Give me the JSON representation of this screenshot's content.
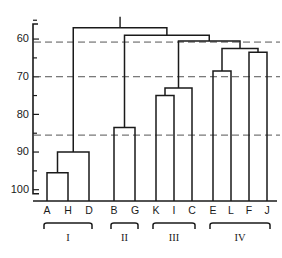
{
  "figure": {
    "name": "hierarchical-clustering-dendrogram",
    "background": "#ffffff",
    "line_color": "#1a1a1a",
    "cut_line_color": "#555555"
  },
  "chart_data": {
    "type": "line",
    "title": "",
    "subtitle": "",
    "xlabel": "",
    "ylabel": "",
    "orientation": "vertical-hanging",
    "grid": false,
    "legend": "none",
    "yaxis": {
      "inverted": true,
      "ylim": [
        103,
        56
      ],
      "tick_labels": [
        "60",
        "70",
        "80",
        "90",
        "100"
      ],
      "tick_values": [
        60,
        70,
        80,
        90,
        100
      ],
      "minor_tick_values": [
        55,
        65,
        75,
        85,
        95
      ],
      "tick_label_60": "60",
      "tick_label_70": "70",
      "tick_label_80": "80",
      "tick_label_90": "90",
      "tick_label_100": "100"
    },
    "leaves": [
      {
        "label": "A",
        "x": 47
      },
      {
        "label": "H",
        "x": 68
      },
      {
        "label": "D",
        "x": 89
      },
      {
        "label": "B",
        "x": 114
      },
      {
        "label": "G",
        "x": 135
      },
      {
        "label": "K",
        "x": 156
      },
      {
        "label": "I",
        "x": 174
      },
      {
        "label": "C",
        "x": 192
      },
      {
        "label": "E",
        "x": 213
      },
      {
        "label": "L",
        "x": 231
      },
      {
        "label": "F",
        "x": 249
      },
      {
        "label": "J",
        "x": 267
      }
    ],
    "merges": [
      {
        "id": "m1",
        "left": "A",
        "right": "H",
        "height": 95.5
      },
      {
        "id": "m2",
        "left": "m1",
        "right": "D",
        "height": 90.0
      },
      {
        "id": "m3",
        "left": "B",
        "right": "G",
        "height": 83.5
      },
      {
        "id": "m4",
        "left": "K",
        "right": "I",
        "height": 75.0
      },
      {
        "id": "m5",
        "left": "m4",
        "right": "C",
        "height": 73.0
      },
      {
        "id": "m6",
        "left": "E",
        "right": "L",
        "height": 68.5
      },
      {
        "id": "m7",
        "left": "F",
        "right": "J",
        "height": 63.5
      },
      {
        "id": "m8",
        "left": "m6",
        "right": "m7",
        "height": 62.5
      },
      {
        "id": "m9",
        "left": "m5",
        "right": "m8",
        "height": 60.5
      },
      {
        "id": "m10",
        "left": "m3",
        "right": "m9",
        "height": 59.0
      },
      {
        "id": "m11",
        "left": "m2",
        "right": "m10",
        "height": 57.0
      }
    ],
    "cut_lines": [
      {
        "value": 60.8
      },
      {
        "value": 70.0
      },
      {
        "value": 85.5
      }
    ],
    "clusters": [
      {
        "label": "I",
        "members": [
          "A",
          "H",
          "D"
        ]
      },
      {
        "label": "II",
        "members": [
          "B",
          "G"
        ]
      },
      {
        "label": "III",
        "members": [
          "K",
          "I",
          "C"
        ]
      },
      {
        "label": "IV",
        "members": [
          "E",
          "L",
          "F",
          "J"
        ]
      }
    ]
  }
}
